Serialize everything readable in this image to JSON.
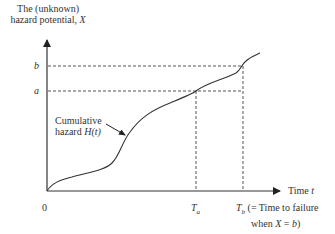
{
  "y_axis": {
    "title_line1": "The (unknown)",
    "title_line2": "hazard potential, ",
    "title_var": "X",
    "ticks": [
      {
        "label": "b",
        "y": 66
      },
      {
        "label": "a",
        "y": 91
      }
    ]
  },
  "x_axis": {
    "label": "Time ",
    "label_var": "t",
    "origin": "0",
    "ticks": [
      {
        "label": "T",
        "sub": "a",
        "x": 196
      },
      {
        "label": "T",
        "sub": "b",
        "x": 243
      }
    ],
    "tb_note_line1": "(= Time to failure",
    "tb_note_line2a": "when ",
    "tb_note_var": "X",
    "tb_note_line2b": " = ",
    "tb_note_val": "b",
    "tb_note_close": ")"
  },
  "curve": {
    "label_line1": "Cumulative",
    "label_line2": "hazard ",
    "label_func": "H(t)"
  },
  "colors": {
    "ink": "#333333",
    "dash": "#555555"
  }
}
